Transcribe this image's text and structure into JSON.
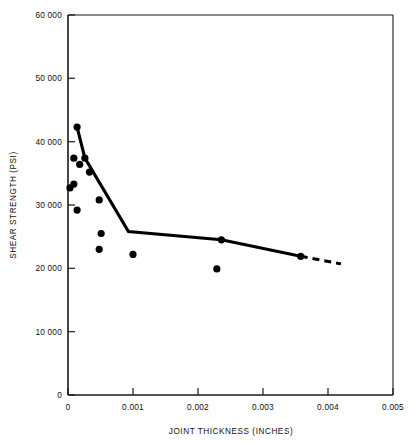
{
  "chart_data": {
    "type": "scatter",
    "title": "",
    "xlabel": "JOINT THICKNESS (INCHES)",
    "ylabel": "SHEAR STRENGTH (PSI)",
    "xlim": [
      0,
      0.005
    ],
    "ylim": [
      0,
      60000
    ],
    "grid": false,
    "legend": null,
    "x_ticks": [
      0,
      0.001,
      0.002,
      0.003,
      0.004,
      0.005
    ],
    "x_tick_labels": [
      "0",
      "0.001",
      "0.002",
      "0.003",
      "0.004",
      "0.005"
    ],
    "y_ticks": [
      0,
      10000,
      20000,
      30000,
      40000,
      50000,
      60000
    ],
    "y_tick_labels": [
      "0",
      "10 000",
      "20 000",
      "30 000",
      "40 000",
      "50 000",
      "60 000"
    ],
    "series": [
      {
        "name": "measured points",
        "type": "scatter",
        "marker": "filled-circle",
        "color": "#000000",
        "points": [
          {
            "x": 0.00014,
            "y": 42300
          },
          {
            "x": 9e-05,
            "y": 37400
          },
          {
            "x": 0.00018,
            "y": 36400
          },
          {
            "x": 0.00026,
            "y": 37400
          },
          {
            "x": 0.00033,
            "y": 35200
          },
          {
            "x": 3e-05,
            "y": 32700
          },
          {
            "x": 9e-05,
            "y": 33300
          },
          {
            "x": 0.00048,
            "y": 30800
          },
          {
            "x": 0.00014,
            "y": 29200
          },
          {
            "x": 0.00051,
            "y": 25500
          },
          {
            "x": 0.00048,
            "y": 23000
          },
          {
            "x": 0.001,
            "y": 22200
          },
          {
            "x": 0.00229,
            "y": 19900
          },
          {
            "x": 0.00236,
            "y": 24500
          },
          {
            "x": 0.00358,
            "y": 21900
          }
        ]
      },
      {
        "name": "trend line",
        "type": "line",
        "style": "solid",
        "color": "#000000",
        "points": [
          {
            "x": 0.00014,
            "y": 42300
          },
          {
            "x": 0.00026,
            "y": 37400
          },
          {
            "x": 0.00093,
            "y": 25800
          },
          {
            "x": 0.00236,
            "y": 24500
          },
          {
            "x": 0.00358,
            "y": 21900
          }
        ]
      },
      {
        "name": "trend line extrapolation",
        "type": "line",
        "style": "dashed",
        "color": "#000000",
        "points": [
          {
            "x": 0.00358,
            "y": 21900
          },
          {
            "x": 0.0042,
            "y": 20700
          }
        ]
      }
    ]
  },
  "axes": {
    "x_title": "JOINT THICKNESS (INCHES)",
    "y_title": "SHEAR STRENGTH (PSI)"
  }
}
